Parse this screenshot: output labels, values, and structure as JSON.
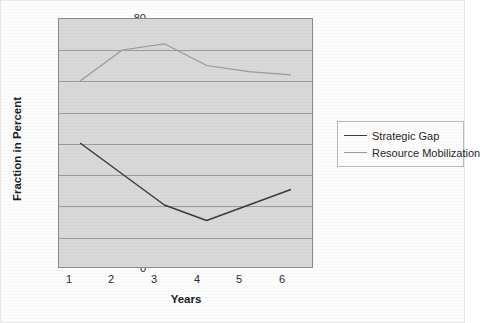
{
  "chart_data": {
    "type": "line",
    "title": "",
    "xlabel": "Years",
    "ylabel": "Fraction in Percent",
    "x": [
      1,
      2,
      3,
      4,
      5,
      6
    ],
    "xticklabels": [
      "1",
      "2",
      "3",
      "4",
      "5",
      "6"
    ],
    "yticklabels": [
      "0",
      "10",
      "20",
      "30",
      "40",
      "50",
      "60",
      "70",
      "80"
    ],
    "yticks": [
      0,
      10,
      20,
      30,
      40,
      50,
      60,
      70,
      80
    ],
    "ylim": [
      0,
      80
    ],
    "xlim": [
      0.5,
      6.5
    ],
    "grid": "horizontal",
    "legend_position": "right",
    "plot_background": "#d9d9d9",
    "series": [
      {
        "name": "Strategic Gap",
        "color": "#3a3a3a",
        "values": [
          40,
          30,
          20,
          15,
          20,
          25
        ]
      },
      {
        "name": "Resource Mobilization",
        "color": "#9a9a9a",
        "values": [
          60,
          70,
          72,
          65,
          63,
          62
        ]
      }
    ]
  }
}
